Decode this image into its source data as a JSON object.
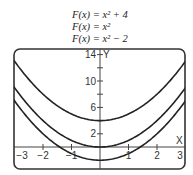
{
  "chart_data": {
    "type": "line",
    "title": "",
    "legend": [
      "F(x) = x² + 4",
      "F(x) = x²",
      "F(x) = x² − 2"
    ],
    "legend_position": "top",
    "xlabel": "X",
    "ylabel": "Y",
    "xlim": [
      -3,
      3
    ],
    "ylim": [
      -2.5,
      14.5
    ],
    "x_ticks": [
      -3,
      -2,
      -1,
      1,
      2,
      3
    ],
    "x_tick_labels": [
      "−3",
      "−2",
      "−1",
      "1",
      "2",
      "3"
    ],
    "y_ticks": [
      2,
      6,
      10,
      14
    ],
    "y_tick_labels": [
      "2",
      "6",
      "10",
      "14"
    ],
    "y_minor_ticks": [
      4,
      8,
      12
    ],
    "grid": false,
    "series": [
      {
        "name": "F(x) = x² + 4",
        "x": [
          -3,
          -2,
          -1,
          0,
          1,
          2,
          3
        ],
        "values": [
          13,
          8,
          5,
          4,
          5,
          8,
          13
        ]
      },
      {
        "name": "F(x) = x²",
        "x": [
          -3,
          -2,
          -1,
          0,
          1,
          2,
          3
        ],
        "values": [
          9,
          4,
          1,
          0,
          1,
          4,
          9
        ]
      },
      {
        "name": "F(x) = x² − 2",
        "x": [
          -3,
          -2,
          -1,
          0,
          1,
          2,
          3
        ],
        "values": [
          7,
          2,
          -1,
          -2,
          -1,
          2,
          7
        ]
      }
    ],
    "line_color": "#222222"
  }
}
